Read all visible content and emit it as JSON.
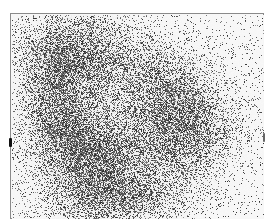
{
  "image": {
    "description": "Grayscale grainy scintigraphy-style scan with diffuse dark uptake regions",
    "colors": {
      "background": "#ffffff",
      "frame": "#8a8a8a",
      "uptake": "#3a3a3a",
      "marker": "#111111"
    },
    "regions": [
      {
        "name": "upper-left-uptake"
      },
      {
        "name": "lower-left-uptake"
      },
      {
        "name": "right-center-uptake"
      }
    ],
    "markers": [
      "left-edge-marker",
      "right-edge-marker"
    ]
  }
}
